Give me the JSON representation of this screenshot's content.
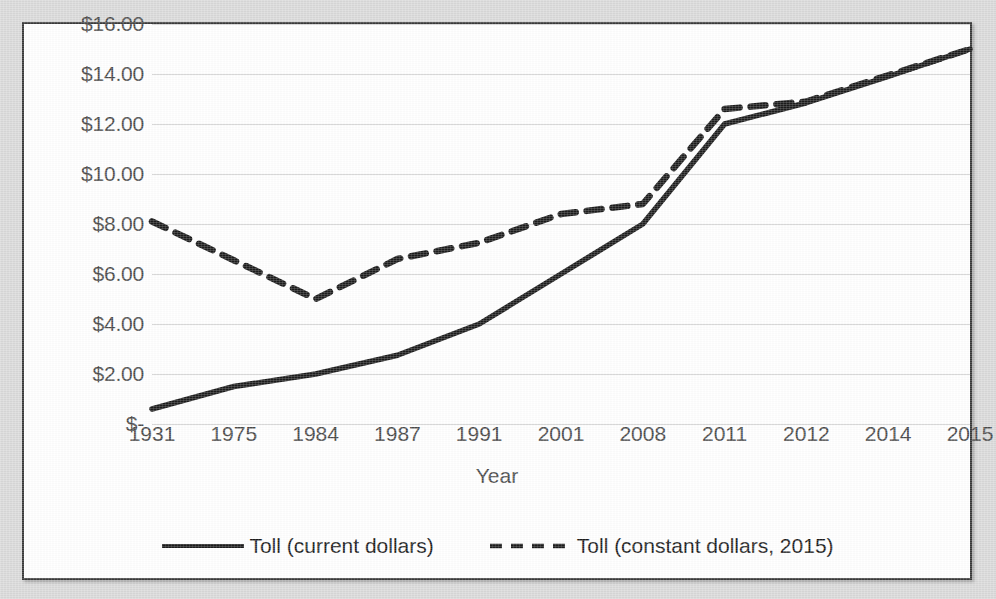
{
  "chart_data": {
    "type": "line",
    "title": "",
    "xlabel": "Year",
    "ylabel": "",
    "categories": [
      "1931",
      "1975",
      "1984",
      "1987",
      "1991",
      "2001",
      "2008",
      "2011",
      "2012",
      "2014",
      "2015"
    ],
    "ylim": [
      0,
      16
    ],
    "ytick_values": [
      16,
      14,
      12,
      10,
      8,
      6,
      4,
      2,
      0
    ],
    "ytick_labels": [
      "$16.00",
      "$14.00",
      "$12.00",
      "$10.00",
      "$8.00",
      "$6.00",
      "$4.00",
      "$2.00",
      "$-"
    ],
    "grid": true,
    "legend_position": "bottom",
    "series": [
      {
        "name": "Toll (current dollars)",
        "style": "solid",
        "color": "#1c1c1c",
        "values": [
          0.6,
          1.5,
          2.0,
          2.75,
          4.0,
          6.0,
          8.0,
          12.0,
          12.85,
          13.9,
          15.0
        ]
      },
      {
        "name": "Toll (constant dollars, 2015)",
        "style": "dashed",
        "color": "#1c1c1c",
        "values": [
          8.1,
          6.55,
          5.0,
          6.6,
          7.25,
          8.4,
          8.8,
          12.6,
          12.9,
          13.95,
          15.0
        ]
      }
    ]
  },
  "axis": {
    "x_title": "Year"
  },
  "legend": {
    "items": [
      {
        "label": "Toll (current dollars)",
        "style": "solid"
      },
      {
        "label": "Toll (constant dollars, 2015)",
        "style": "dashed"
      }
    ]
  }
}
